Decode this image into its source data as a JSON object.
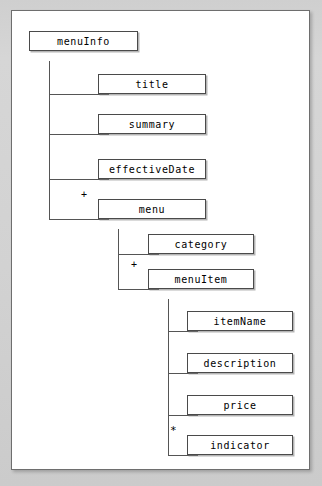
{
  "diagram": {
    "type": "xml-schema-tree",
    "root_label": "menuInfo",
    "colors": {
      "page_background": "#d2d2d2",
      "frame_background": "#ffffff",
      "frame_border": "#6e6e6e",
      "node_border": "#4a4a4a",
      "node_background": "#ffffff",
      "connector": "#555555",
      "text": "#000000"
    },
    "markers": {
      "sequence": "+",
      "repeat": "*"
    },
    "nodes": [
      {
        "id": "menuInfo",
        "label": "menuInfo",
        "level": 0,
        "marker": "",
        "x": 28,
        "y": 30,
        "w": 109
      },
      {
        "id": "title",
        "label": "title",
        "level": 1,
        "marker": "",
        "x": 97,
        "y": 73,
        "w": 108
      },
      {
        "id": "summary",
        "label": "summary",
        "level": 1,
        "marker": "",
        "x": 97,
        "y": 113,
        "w": 108
      },
      {
        "id": "effectiveDate",
        "label": "effectiveDate",
        "level": 1,
        "marker": "",
        "x": 97,
        "y": 158,
        "w": 108
      },
      {
        "id": "menu",
        "label": "menu",
        "level": 1,
        "marker": "+",
        "x": 97,
        "y": 198,
        "w": 108
      },
      {
        "id": "category",
        "label": "category",
        "level": 2,
        "marker": "",
        "x": 147,
        "y": 233,
        "w": 106
      },
      {
        "id": "menuItem",
        "label": "menuItem",
        "level": 2,
        "marker": "+",
        "x": 147,
        "y": 268,
        "w": 106
      },
      {
        "id": "itemName",
        "label": "itemName",
        "level": 3,
        "marker": "",
        "x": 186,
        "y": 310,
        "w": 106
      },
      {
        "id": "description",
        "label": "description",
        "level": 3,
        "marker": "",
        "x": 186,
        "y": 352,
        "w": 106
      },
      {
        "id": "price",
        "label": "price",
        "level": 3,
        "marker": "",
        "x": 186,
        "y": 394,
        "w": 106
      },
      {
        "id": "indicator",
        "label": "indicator",
        "level": 3,
        "marker": "*",
        "x": 186,
        "y": 434,
        "w": 106
      }
    ],
    "edges": [
      {
        "from": "menuInfo",
        "to": "title"
      },
      {
        "from": "menuInfo",
        "to": "summary"
      },
      {
        "from": "menuInfo",
        "to": "effectiveDate"
      },
      {
        "from": "menuInfo",
        "to": "menu"
      },
      {
        "from": "menu",
        "to": "category"
      },
      {
        "from": "menu",
        "to": "menuItem"
      },
      {
        "from": "menuItem",
        "to": "itemName"
      },
      {
        "from": "menuItem",
        "to": "description"
      },
      {
        "from": "menuItem",
        "to": "price"
      },
      {
        "from": "menuItem",
        "to": "indicator"
      }
    ]
  }
}
